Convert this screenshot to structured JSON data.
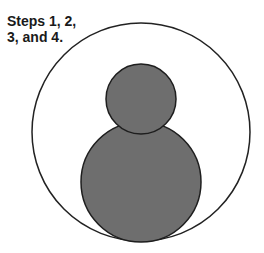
{
  "caption": {
    "line1": "Steps 1, 2,",
    "line2": "3, and 4."
  },
  "diagram": {
    "outer_circle": {
      "cx": 141,
      "cy": 132,
      "r": 109,
      "fill": "#ffffff",
      "stroke": "#222222"
    },
    "head_circle": {
      "cx": 141,
      "cy": 99,
      "r": 35,
      "fill": "#6e6e6e",
      "stroke": "#1e1e1e"
    },
    "body_circle": {
      "cx": 141,
      "cy": 182,
      "r": 60,
      "fill": "#6e6e6e",
      "stroke": "#1e1e1e"
    }
  }
}
